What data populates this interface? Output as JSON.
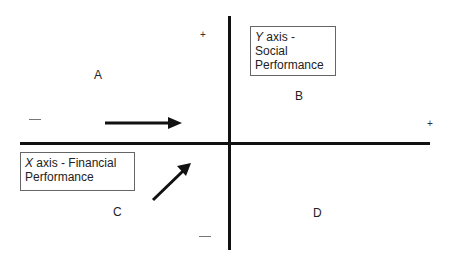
{
  "diagram": {
    "type": "quadrant",
    "axes": {
      "y_axis_label_prefix": "Y",
      "y_axis_label_rest": " axis -",
      "y_axis_label_line2": "Social",
      "y_axis_label_line3": "Performance",
      "x_axis_label_prefix": "X",
      "x_axis_label_rest": " axis - Financial",
      "x_axis_label_line2": "Performance"
    },
    "quadrants": {
      "a": "A",
      "b": "B",
      "c": "C",
      "d": "D"
    },
    "signs": {
      "y_top": "+",
      "x_right": "+",
      "x_left": "—",
      "y_bottom": "—"
    },
    "arrows": [
      {
        "name": "horizontal-arrow",
        "direction": "right",
        "from": [
          105,
          123
        ],
        "to": [
          180,
          123
        ]
      },
      {
        "name": "diagonal-arrow",
        "direction": "up-right",
        "from": [
          153,
          200
        ],
        "to": [
          190,
          165
        ]
      }
    ]
  }
}
